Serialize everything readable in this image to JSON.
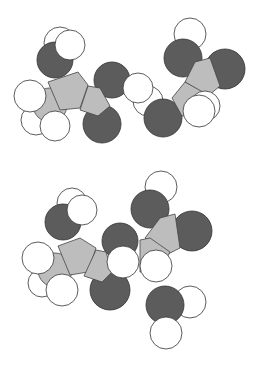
{
  "diagram": {
    "type": "space-filling molecular model",
    "colors": {
      "oxygen_or_nitrogen": "#5c5c5c",
      "carbon": "#bdbdbd",
      "hydrogen": "#ffffff",
      "outline": "#333333"
    },
    "panels": [
      {
        "name": "top-molecule",
        "description": "two amino acids / fragments, separate"
      },
      {
        "name": "bottom-molecule",
        "description": "joined dipeptide plus water molecule"
      }
    ]
  }
}
